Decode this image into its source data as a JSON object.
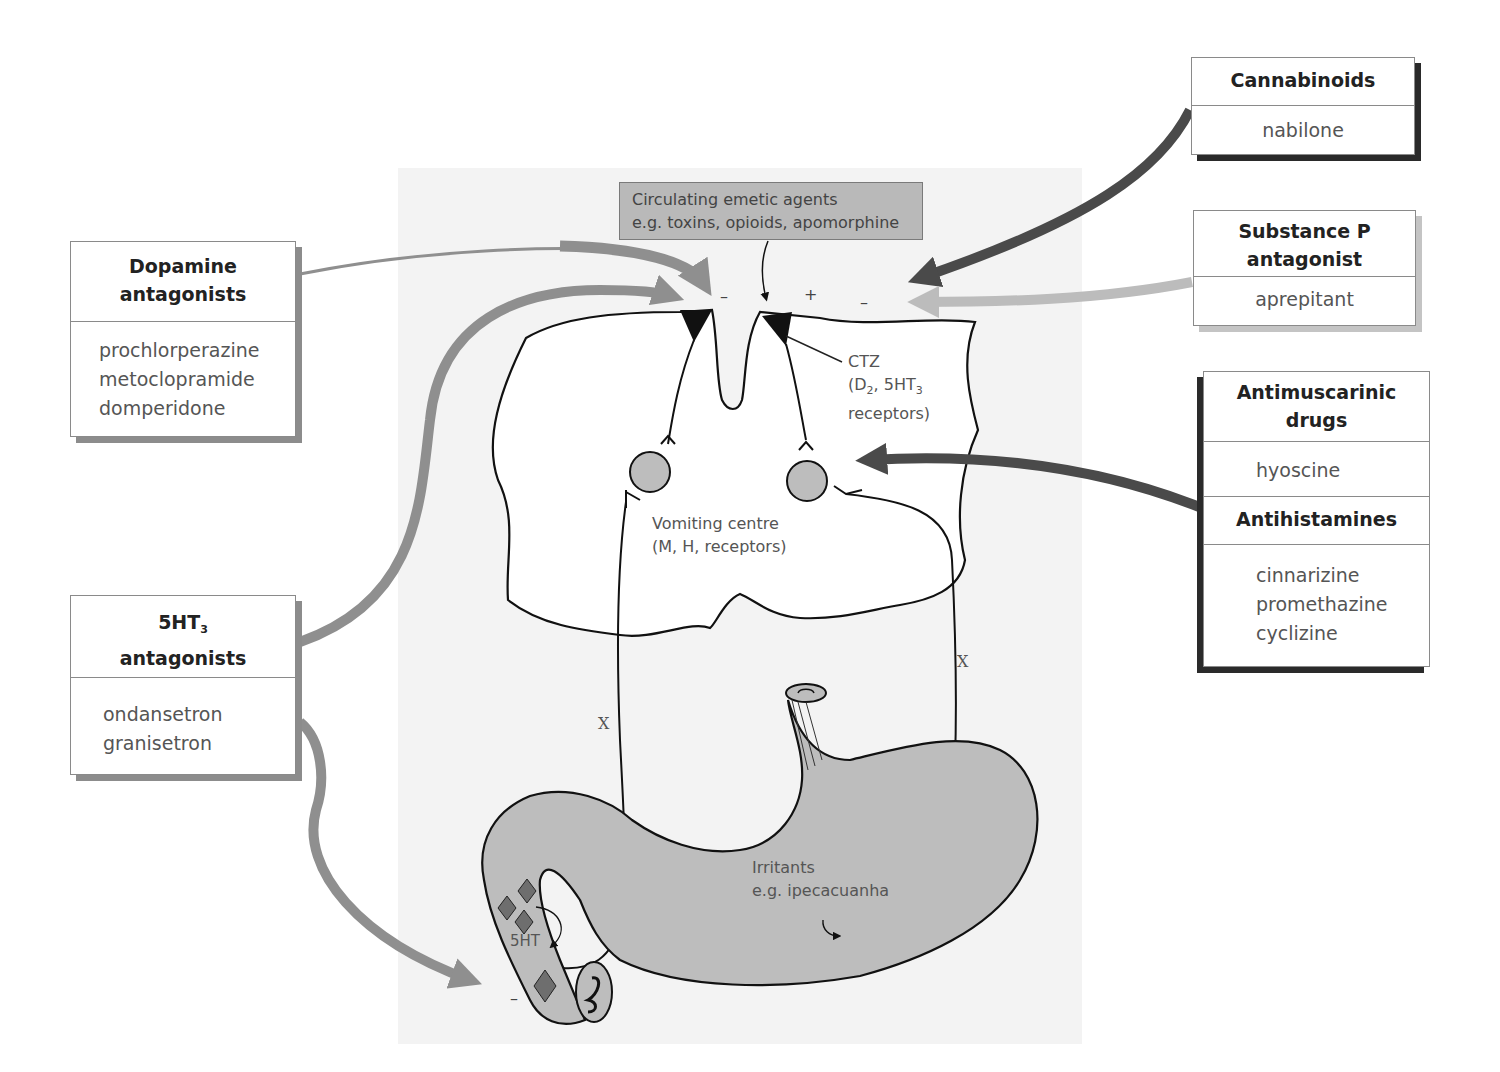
{
  "diagram": {
    "title_region": "Emetic pathways and antiemetic drug targets",
    "colors": {
      "panel_bg": "#f3f3f3",
      "organ_fill": "#bdbdbd",
      "arrow_mid_grey": "#8f8f8f",
      "arrow_dark": "#4a4a4a",
      "arrow_light": "#bcbcbc",
      "receptor_black": "#111111",
      "diamond": "#6e6e6e"
    },
    "circulating_agents": {
      "line1": "Circulating emetic agents",
      "line2": "e.g. toxins, opioids, apomorphine"
    },
    "signs": {
      "dopamine_minus": "–",
      "circulating_plus": "+",
      "cannabinoid_minus": "–",
      "gut_minus": "–"
    },
    "ctz": {
      "line1": "CTZ",
      "line2_pre": "(D",
      "line2_sub1": "2",
      "line2_mid": ", 5HT",
      "line2_sub2": "3",
      "line3": "receptors)"
    },
    "vomiting_centre": {
      "line1": "Vomiting centre",
      "line2": "(M, H, receptors)"
    },
    "vagus_marks": [
      "X",
      "X"
    ],
    "gut": {
      "label_5ht": "5HT",
      "irritants_line1": "Irritants",
      "irritants_line2": "e.g. ipecacuanha"
    }
  },
  "drug_boxes": {
    "dopamine": {
      "header_line1": "Dopamine",
      "header_line2": "antagonists",
      "drugs": [
        "prochlorperazine",
        "metoclopramide",
        "domperidone"
      ]
    },
    "ht3": {
      "header_prefix": "5HT",
      "header_sub": "3",
      "header_line2": "antagonists",
      "drugs": [
        "ondansetron",
        "granisetron"
      ]
    },
    "cannabinoids": {
      "header": "Cannabinoids",
      "drugs": [
        "nabilone"
      ]
    },
    "substance_p": {
      "header_line1": "Substance P",
      "header_line2": "antagonist",
      "drugs": [
        "aprepitant"
      ]
    },
    "antimuscarinic": {
      "header_line1": "Antimuscarinic",
      "header_line2": "drugs",
      "drugs": [
        "hyoscine"
      ]
    },
    "antihistamines": {
      "header": "Antihistamines",
      "drugs": [
        "cinnarizine",
        "promethazine",
        "cyclizine"
      ]
    }
  }
}
